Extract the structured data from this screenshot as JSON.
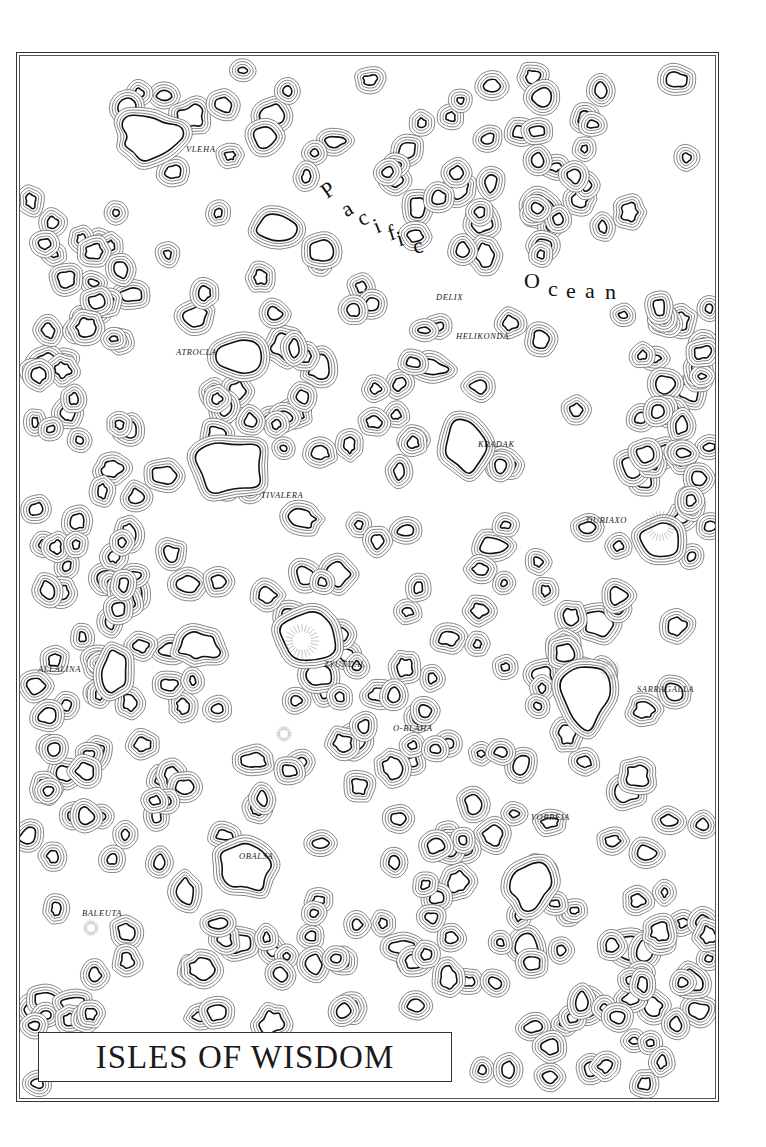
{
  "map": {
    "title": "ISLES OF WISDOM",
    "ocean": {
      "word1": "Pacific",
      "word2": "Ocean"
    },
    "colors": {
      "ink": "#1a1a1a",
      "contour": "#555555",
      "paper": "#ffffff"
    },
    "labels": [
      {
        "name": "VLEHA",
        "x": 186,
        "y": 150
      },
      {
        "name": "DELIX",
        "x": 436,
        "y": 298
      },
      {
        "name": "HELIKONDA",
        "x": 456,
        "y": 337
      },
      {
        "name": "ATROCLA",
        "x": 176,
        "y": 353
      },
      {
        "name": "KRADAK",
        "x": 478,
        "y": 445
      },
      {
        "name": "TIVALERA",
        "x": 261,
        "y": 496
      },
      {
        "name": "DUBIAXO",
        "x": 586,
        "y": 521
      },
      {
        "name": "ALLALINA",
        "x": 38,
        "y": 670
      },
      {
        "name": "ZYUNDAL",
        "x": 324,
        "y": 665
      },
      {
        "name": "SARRAGALLA",
        "x": 637,
        "y": 690
      },
      {
        "name": "O-BLAHA",
        "x": 393,
        "y": 729
      },
      {
        "name": "VORREIA",
        "x": 531,
        "y": 818
      },
      {
        "name": "OBALSA",
        "x": 239,
        "y": 857
      },
      {
        "name": "BALEUTA",
        "x": 82,
        "y": 914
      }
    ]
  }
}
